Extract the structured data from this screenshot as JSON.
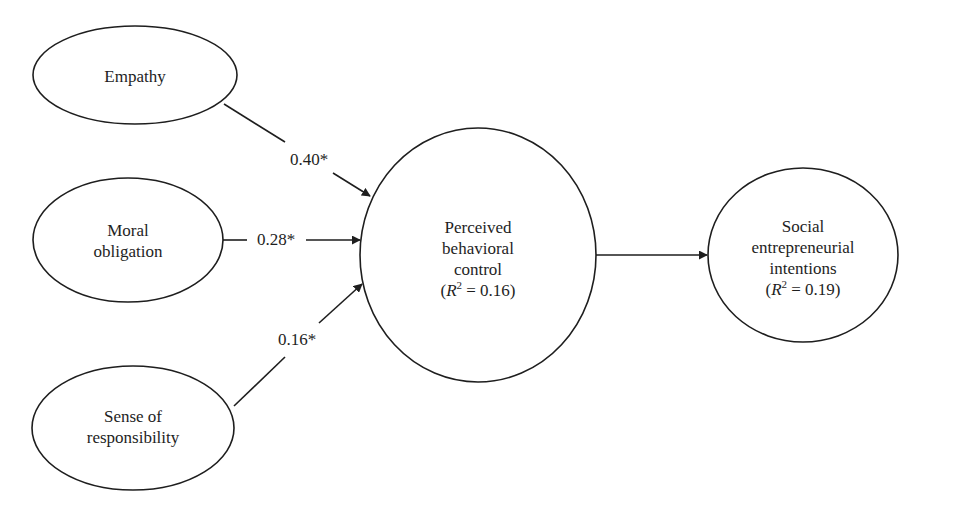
{
  "diagram": {
    "nodes": [
      {
        "id": "empathy",
        "lines": [
          "Empathy"
        ],
        "shape": "ellipse"
      },
      {
        "id": "moral_obligation",
        "lines": [
          "Moral",
          "obligation"
        ],
        "shape": "ellipse"
      },
      {
        "id": "sense_of_responsibility",
        "lines": [
          "Sense of",
          "responsibility"
        ],
        "shape": "ellipse"
      },
      {
        "id": "perceived_behavioral_control",
        "lines": [
          "Perceived",
          "behavioral",
          "control"
        ],
        "r2_symbol": "R",
        "r2_exp": "2",
        "r2_value": "= 0.16",
        "r2_open": "(",
        "r2_close": ")",
        "shape": "circle"
      },
      {
        "id": "social_entrepreneurial_intentions",
        "lines": [
          "Social",
          "entrepreneurial",
          "intentions"
        ],
        "r2_symbol": "R",
        "r2_exp": "2",
        "r2_value": "= 0.19",
        "r2_open": "(",
        "r2_close": ")",
        "shape": "ellipse"
      }
    ],
    "edges": [
      {
        "from": "empathy",
        "to": "perceived_behavioral_control",
        "label": "0.40*"
      },
      {
        "from": "moral_obligation",
        "to": "perceived_behavioral_control",
        "label": "0.28*"
      },
      {
        "from": "sense_of_responsibility",
        "to": "perceived_behavioral_control",
        "label": "0.16*"
      },
      {
        "from": "perceived_behavioral_control",
        "to": "social_entrepreneurial_intentions",
        "label": ""
      }
    ],
    "colors": {
      "stroke": "#1e1e1e",
      "background": "#ffffff"
    }
  }
}
